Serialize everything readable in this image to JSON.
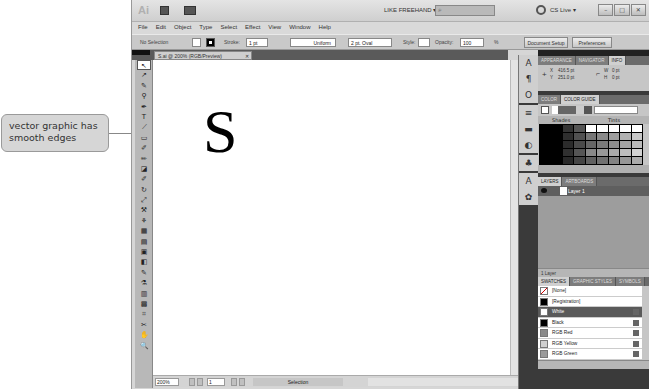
{
  "app": {
    "logo": "Ai",
    "workspace": "LIKE FREEHAND ▾",
    "search_placeholder": "",
    "cs_live": "CS Live ▾",
    "window_buttons": [
      "–",
      "□",
      "✕"
    ]
  },
  "menubar": [
    "File",
    "Edit",
    "Object",
    "Type",
    "Select",
    "Effect",
    "View",
    "Window",
    "Help"
  ],
  "control_bar": {
    "selection": "No Selection",
    "stroke_label": "Stroke:",
    "stroke_value": "1 pt",
    "profile": "Uniform",
    "brush": "2 pt. Oval",
    "style_label": "Style:",
    "opacity_label": "Opacity:",
    "opacity_value": "100",
    "opacity_unit": "%",
    "document_setup": "Document Setup",
    "preferences": "Preferences"
  },
  "document": {
    "tab": "S.ai @ 200% (RGB/Preview)",
    "tab_close": "✕",
    "artwork_letter": "S"
  },
  "status_bar": {
    "zoom": "200%",
    "artboard": "1",
    "status": "Selection"
  },
  "tools": [
    "↖",
    "↗",
    "✎",
    "⚲",
    "✒",
    "T",
    "⟋",
    "▭",
    "✐",
    "✏",
    "◪",
    "✐",
    "↻",
    "⤢",
    "⚒",
    "⚘",
    "▦",
    "▤",
    "▣",
    "◧",
    "✎",
    "⚗",
    "▥",
    "▩",
    "⌗",
    "✂",
    "✋",
    "🔍"
  ],
  "icon_strip": {
    "group1": [
      "A",
      "¶",
      "O"
    ],
    "group2": [
      "≡",
      "▬",
      "◐"
    ],
    "group3": [
      "♣"
    ],
    "group4": [
      "A",
      "✿"
    ]
  },
  "panels": {
    "info": {
      "tabs": [
        "APPEARANCE",
        "NAVIGATOR",
        "INFO"
      ],
      "active": "INFO",
      "x_label": "X",
      "x_value": "416.5 pt",
      "y_label": "Y",
      "y_value": "251.0 pt",
      "w_label": "W",
      "w_value": "0 pt",
      "h_label": "H",
      "h_value": "0 pt"
    },
    "color_guide": {
      "tabs": [
        "COLOR",
        "COLOR GUIDE"
      ],
      "active": "COLOR GUIDE",
      "shades_label": "Shades",
      "tints_label": "Tints"
    },
    "layers": {
      "tabs": [
        "LAYERS",
        "ARTBOARDS"
      ],
      "active": "LAYERS",
      "layer_name": "Layer 1",
      "footer": "1 Layer"
    },
    "swatches": {
      "tabs": [
        "SWATCHES",
        "GRAPHIC STYLES",
        "SYMBOLS"
      ],
      "active": "SWATCHES",
      "items": [
        {
          "name": "[None]",
          "color": "#ffffff"
        },
        {
          "name": "[Registration]",
          "color": "#000000"
        },
        {
          "name": "White",
          "color": "#ffffff"
        },
        {
          "name": "Black",
          "color": "#000000"
        },
        {
          "name": "RGB Red",
          "color": "#8a8a8a"
        },
        {
          "name": "RGB Yellow",
          "color": "#cfcfcf"
        },
        {
          "name": "RGB Green",
          "color": "#9a9a9a"
        }
      ],
      "selected": "White"
    }
  },
  "callout": {
    "text": "vector graphic has smooth edges"
  }
}
